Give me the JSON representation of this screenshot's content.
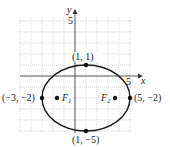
{
  "figure": {
    "type": "ellipse-graph",
    "axes": {
      "x_label": "x",
      "y_label": "y",
      "x_tick": "5",
      "y_tick": "5",
      "xlim": [
        -5,
        5
      ],
      "ylim": [
        -5,
        5
      ]
    },
    "ellipse": {
      "center": [
        1,
        -2
      ],
      "a": 4,
      "b": 3
    },
    "points": [
      {
        "label": "(1, 1)",
        "x": 1,
        "y": 1
      },
      {
        "label": "(-3, -2)",
        "display": "(−3, −2)",
        "x": -3,
        "y": -2
      },
      {
        "label": "(5, -2)",
        "display": "(5, −2)",
        "x": 5,
        "y": -2
      },
      {
        "label": "(1, -5)",
        "display": "(1, −5)",
        "x": 1,
        "y": -5
      }
    ],
    "foci": [
      {
        "label": "F",
        "sub": "1",
        "x": -1.65,
        "y": -2
      },
      {
        "label": "F",
        "sub": "2",
        "x": 3.65,
        "y": -2
      }
    ]
  },
  "colors": {
    "curve": "#1a1a1a",
    "grid": "#bdbdbd",
    "text": "#222222"
  }
}
